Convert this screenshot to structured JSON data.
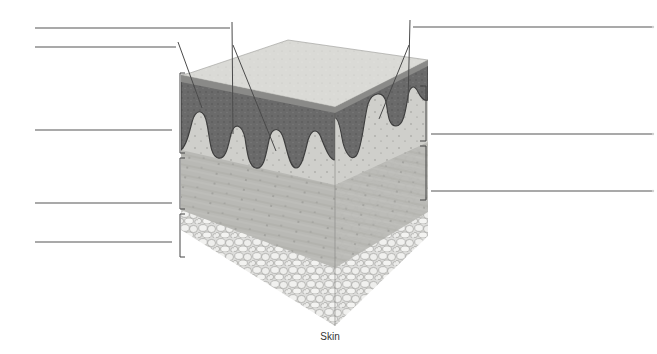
{
  "figure": {
    "caption": "Skin",
    "colors": {
      "background": "#ffffff",
      "stratum_corneum": "#d9d9d6",
      "epidermis": "#6e6e6e",
      "epidermis_dark": "#4a4a4a",
      "papillary_dermis": "#c9c9c5",
      "reticular_dermis": "#b4b4b0",
      "hypodermis_fat": "#e9e9e7",
      "fat_cell_border": "#9a9a97",
      "label_line": "#555555"
    }
  },
  "labels": {
    "left": [
      {
        "id": "label-left-1",
        "text": "",
        "y": 28
      },
      {
        "id": "label-left-2",
        "text": "",
        "y": 47
      },
      {
        "id": "label-left-3",
        "text": "",
        "y": 130
      },
      {
        "id": "label-left-4",
        "text": "",
        "y": 203
      },
      {
        "id": "label-left-5",
        "text": "",
        "y": 242
      }
    ],
    "right": [
      {
        "id": "label-right-1",
        "text": "",
        "y": 27
      },
      {
        "id": "label-right-2",
        "text": "",
        "y": 134
      },
      {
        "id": "label-right-3",
        "text": "",
        "y": 191
      }
    ]
  },
  "brackets": {
    "left": [
      {
        "name": "epidermis-bracket",
        "y1": 73,
        "y2": 153
      },
      {
        "name": "dermis-bracket",
        "y1": 158,
        "y2": 209
      },
      {
        "name": "hypodermis-bracket",
        "y1": 214,
        "y2": 257
      }
    ],
    "right": [
      {
        "name": "papillary-layer-bracket",
        "y1": 86,
        "y2": 141
      },
      {
        "name": "reticular-layer-bracket",
        "y1": 146,
        "y2": 200
      }
    ]
  }
}
